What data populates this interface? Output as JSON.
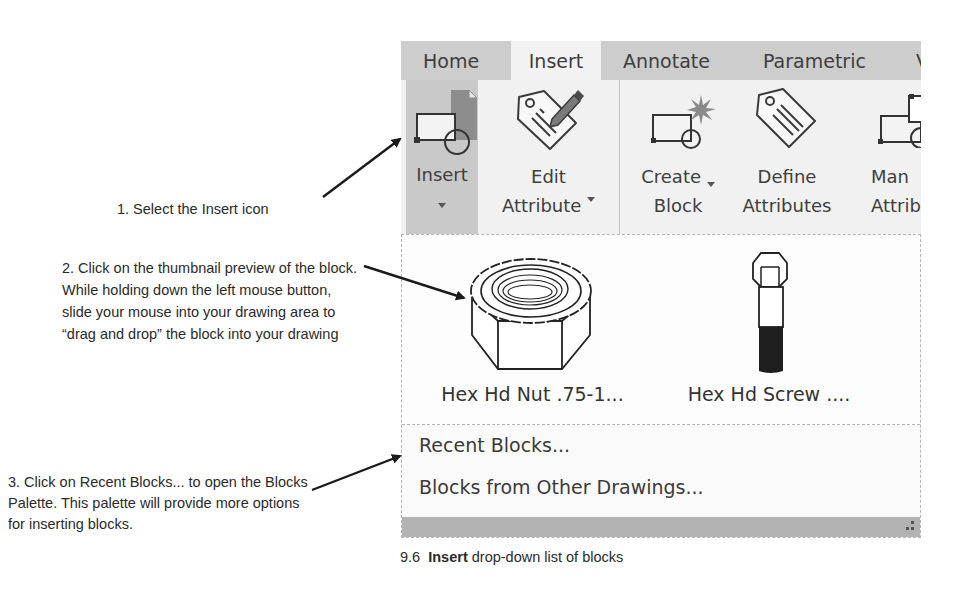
{
  "callouts": [
    {
      "text": "1. Select the Insert icon"
    },
    {
      "text": "2. Click on the thumbnail preview of the block. While holding down the left mouse button, slide your mouse into your drawing area to “drag and drop” the block into your drawing"
    },
    {
      "text": "3. Click on Recent Blocks... to open the Blocks Palette. This palette will provide more options for inserting blocks."
    }
  ],
  "ribbon": {
    "tabs": [
      {
        "label": "Home",
        "active": false
      },
      {
        "label": "Insert",
        "active": true
      },
      {
        "label": "Annotate",
        "active": false
      },
      {
        "label": "Parametric",
        "active": false
      },
      {
        "label": "V",
        "active": false
      }
    ],
    "tools": [
      {
        "line1": "Insert",
        "line2": "",
        "icon": "insert-block-icon",
        "has_dropdown": true,
        "active": true
      },
      {
        "line1": "Edit",
        "line2": "Attribute",
        "icon": "edit-attribute-icon",
        "has_dropdown": true,
        "active": false
      },
      {
        "line1": "Create",
        "line2": "Block",
        "icon": "create-block-icon",
        "has_dropdown": true,
        "active": false
      },
      {
        "line1": "Define",
        "line2": "Attributes",
        "icon": "define-attributes-icon",
        "has_dropdown": false,
        "active": false
      },
      {
        "line1": "Man",
        "line2": "Attrib",
        "icon": "manage-attributes-icon",
        "has_dropdown": false,
        "active": false
      }
    ]
  },
  "dropdown": {
    "blocks": [
      {
        "name": "Hex Hd Nut .75-1...",
        "icon": "hex-nut-icon"
      },
      {
        "name": "Hex Hd Screw ....",
        "icon": "hex-screw-icon"
      }
    ],
    "menu_items": [
      {
        "label": "Recent Blocks..."
      },
      {
        "label": "Blocks from Other Drawings..."
      }
    ]
  },
  "caption": {
    "number": "9.6",
    "bold": "Insert",
    "rest": "drop-down list of blocks"
  }
}
